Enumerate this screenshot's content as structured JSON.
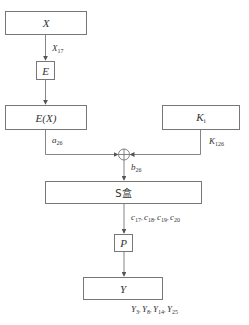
{
  "diagram": {
    "nodes": {
      "x_box": {
        "label": "X"
      },
      "e_box": {
        "label": "E"
      },
      "ex_box": {
        "label": "E(X)"
      },
      "k_box": {
        "label": "K",
        "sub": "i"
      },
      "sbox": {
        "label": "S盒"
      },
      "p_box": {
        "label": "P"
      },
      "y_box": {
        "label": "Y"
      }
    },
    "edges": {
      "x17": {
        "var": "X",
        "sub": "17"
      },
      "a26": {
        "var": "a",
        "sub": "26"
      },
      "k126": {
        "var": "K",
        "sub": "126"
      },
      "b26": {
        "var": "b",
        "sub": "26"
      },
      "c_outputs": [
        {
          "var": "c",
          "sub": "17"
        },
        {
          "var": "c",
          "sub": "18"
        },
        {
          "var": "c",
          "sub": "19"
        },
        {
          "var": "c",
          "sub": "20"
        }
      ],
      "y_outputs": [
        {
          "var": "Y",
          "sub": "3"
        },
        {
          "var": "Y",
          "sub": "8"
        },
        {
          "var": "Y",
          "sub": "14"
        },
        {
          "var": "Y",
          "sub": "25"
        }
      ]
    },
    "xor_symbol": "xor-circle",
    "separator": ", ",
    "line_color": "#666666"
  }
}
